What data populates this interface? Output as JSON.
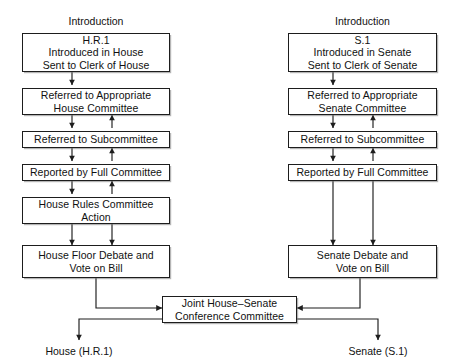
{
  "diagram": {
    "columns": {
      "house": {
        "heading": "Introduction",
        "outcome_label": "House (H.R.1)"
      },
      "senate": {
        "heading": "Introduction",
        "outcome_label": "Senate (S.1)"
      }
    },
    "nodes": {
      "house_intro": "H.R.1\nIntroduced in House\nSent to Clerk of House",
      "house_referred_committee": "Referred to Appropriate\nHouse Committee",
      "house_referred_subcommittee": "Referred to Subcommittee",
      "house_reported_full": "Reported by Full Committee",
      "house_rules": "House Rules Committee\nAction",
      "house_floor": "House Floor Debate and\nVote on Bill",
      "senate_intro": "S.1\nIntroduced in Senate\nSent to Clerk of Senate",
      "senate_referred_committee": "Referred to Appropriate\nSenate Committee",
      "senate_referred_subcommittee": "Referred to Subcommittee",
      "senate_reported_full": "Reported by Full Committee",
      "senate_floor": "Senate Debate and\nVote on Bill",
      "conference": "Joint House–Senate\nConference Committee"
    },
    "colors": {
      "stroke": "#1d1d1d",
      "box_fill": "#ffffff",
      "text": "#111111",
      "background": "#ffffff"
    }
  }
}
